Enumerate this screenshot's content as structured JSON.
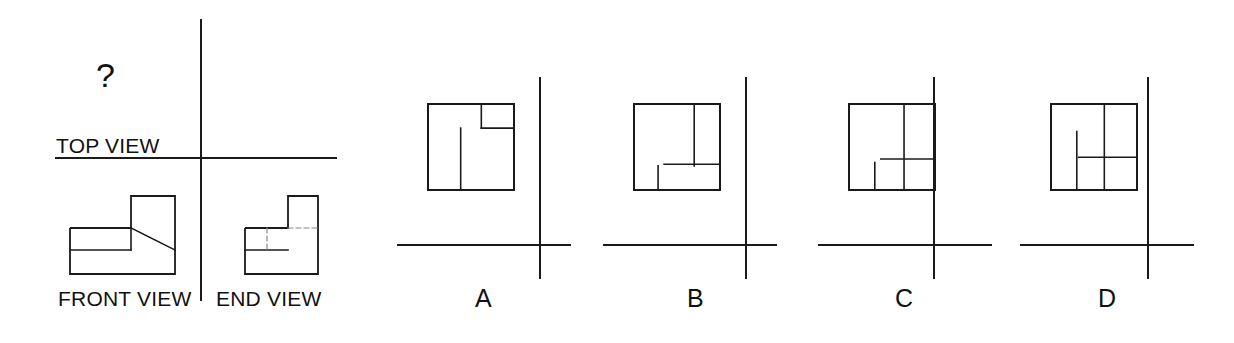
{
  "page": {
    "background_color": "#ffffff",
    "line_color": "#1a1a1a",
    "text_color": "#111111",
    "width": 1234,
    "height": 343
  },
  "question": {
    "prompt_symbol": "?",
    "missing_view": "TOP VIEW",
    "description": "Orthographic projection puzzle: given FRONT VIEW and END VIEW, choose the correct TOP VIEW."
  },
  "given_panel": {
    "axis": {
      "vertical_x": 201,
      "vertical_y1": 20,
      "vertical_y2": 300,
      "horizontal_y": 158,
      "horizontal_x1": 56,
      "horizontal_x2": 336
    },
    "labels": {
      "top_view": "TOP VIEW",
      "front_view": "FRONT VIEW",
      "end_view": "END VIEW",
      "unknown": "?"
    },
    "front_view_shape": {
      "name": "front-view-outline",
      "outline": "70,228 70,274 175,274 175,196 131,196 131,228",
      "notch_lines": [
        "70,250 131,250",
        "131,228 131,250"
      ],
      "diagonal": "131,228 175,250"
    },
    "end_view_shape": {
      "name": "end-view-outline",
      "outline": "245,228 245,274 318,274 318,196 288,196 288,228",
      "solid_inner_lines": [
        "245,250 288,250"
      ],
      "hidden_lines": [
        "267,228 267,250",
        "288,228 318,228"
      ]
    }
  },
  "options": [
    {
      "id": "A",
      "label": "A",
      "square": {
        "x": 428,
        "y": 104,
        "size": 86
      },
      "internal_lines": [
        "v 0.62 0.00 0.28",
        "h 0.28 0.62 1.00",
        "v 0.38 0.28 1.00",
        "h 0.00 0.62 0.38"
      ],
      "axis": {
        "horizontal_y": 245,
        "horizontal_x1": 398,
        "horizontal_x2": 570,
        "vertical_x": 540,
        "vertical_y1": 78,
        "vertical_y2": 278
      }
    },
    {
      "id": "B",
      "label": "B",
      "square": {
        "x": 634,
        "y": 104,
        "size": 86
      },
      "internal_lines": [
        "v 0.70 0.00 0.72",
        "h 0.70 0.35 1.00",
        "h 0.00 0.72 0.70",
        "v 0.28 0.72 1.00"
      ],
      "axis": {
        "horizontal_y": 245,
        "horizontal_x1": 604,
        "horizontal_x2": 776,
        "vertical_x": 746,
        "vertical_y1": 78,
        "vertical_y2": 278
      }
    },
    {
      "id": "C",
      "label": "C",
      "square": {
        "x": 849,
        "y": 104,
        "size": 86
      },
      "internal_lines": [
        "v 0.64 0.00 1.00",
        "h 0.64 0.37 1.00",
        "h 0.00 0.68 0.30",
        "v 0.30 0.68 1.00"
      ],
      "axis": {
        "horizontal_y": 245,
        "horizontal_x1": 819,
        "horizontal_x2": 991,
        "vertical_x": 934,
        "vertical_y1": 78,
        "vertical_y2": 278
      }
    },
    {
      "id": "D",
      "label": "D",
      "square": {
        "x": 1051,
        "y": 104,
        "size": 86
      },
      "internal_lines": [
        "v 0.62 0.00 1.00",
        "h 0.62 0.32 1.00",
        "v 0.30 0.32 1.00",
        "h 0.00 0.32 0.30"
      ],
      "axis": {
        "horizontal_y": 245,
        "horizontal_x1": 1021,
        "horizontal_x2": 1193,
        "vertical_x": 1148,
        "vertical_y1": 78,
        "vertical_y2": 278
      }
    }
  ],
  "option_labels": {
    "a": "A",
    "b": "B",
    "c": "C",
    "d": "D"
  }
}
